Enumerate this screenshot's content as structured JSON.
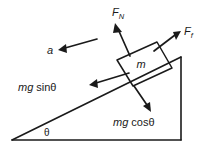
{
  "figure": {
    "type": "free-body-diagram",
    "background_color": "#ffffff",
    "ink_color": "#1a1a1a"
  },
  "labels": {
    "normal_force": {
      "symbol": "F",
      "subscript": "N",
      "text": "F_N"
    },
    "friction_force": {
      "symbol": "F",
      "subscript": "f",
      "text": "F_f"
    },
    "weight_parallel": {
      "prefix": "mg",
      "func": "sinθ",
      "text": "mg sinθ"
    },
    "weight_perpendicular": {
      "prefix": "mg",
      "func": "cosθ",
      "text": "mg cosθ"
    },
    "mass": "m",
    "acceleration": "a",
    "angle": "θ"
  },
  "geometry": {
    "incline_angle_deg": 25,
    "triangle": {
      "left_vertex": [
        12,
        140
      ],
      "apex": [
        181,
        57
      ],
      "right_vertex": [
        181,
        140
      ]
    },
    "block": {
      "corners": [
        [
          117,
          60
        ],
        [
          157,
          42
        ],
        [
          172,
          68
        ],
        [
          133,
          86
        ]
      ],
      "center": [
        144,
        64
      ]
    },
    "vectors": [
      {
        "name": "normal_force",
        "from": [
          128,
          55
        ],
        "to": [
          116,
          26
        ],
        "direction": "up-left perpendicular to incline"
      },
      {
        "name": "friction_force",
        "from": [
          155,
          50
        ],
        "to": [
          178,
          33
        ],
        "direction": "up-slope along incline"
      },
      {
        "name": "weight_parallel",
        "from": [
          128,
          74
        ],
        "to": [
          91,
          84
        ],
        "direction": "down-slope along incline"
      },
      {
        "name": "weight_perpendicular",
        "from": [
          134,
          86
        ],
        "to": [
          149,
          109
        ],
        "direction": "into incline"
      },
      {
        "name": "acceleration",
        "from": [
          97,
          39
        ],
        "to": [
          58,
          50
        ],
        "direction": "up-left"
      }
    ]
  }
}
